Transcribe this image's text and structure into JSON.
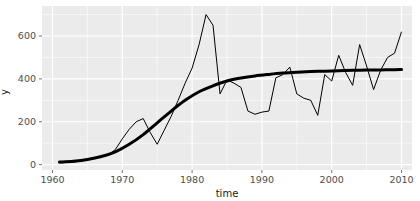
{
  "toolbar": {
    "visible": true,
    "note": "partially cropped toolbar strip"
  },
  "plot": {
    "panel_bg": "#ebebeb",
    "grid_color": "#ffffff",
    "page_bg": "#ffffff",
    "axis_text_color": "#4d4d4d",
    "axis_title_color": "#1a1a1a",
    "data_line_color": "#000000",
    "fit_line_color": "#000000",
    "x_title": "time",
    "y_title": "y",
    "x_ticks": [
      "1960",
      "1970",
      "1980",
      "1990",
      "2000",
      "2010"
    ],
    "y_ticks": [
      "0",
      "200",
      "400",
      "600"
    ]
  },
  "chart_data": {
    "type": "line",
    "title": "",
    "subtitle": "",
    "xlabel": "time",
    "ylabel": "y",
    "xlim": [
      1958.5,
      2011.5
    ],
    "ylim": [
      -25,
      740
    ],
    "grid": true,
    "legend": "none",
    "x_ticks": [
      1960,
      1970,
      1980,
      1990,
      2000,
      2010
    ],
    "y_ticks": [
      0,
      200,
      400,
      600
    ],
    "series": [
      {
        "name": "observed",
        "style": "thin-line",
        "linewidth": 1,
        "color": "#000000",
        "x": [
          1961,
          1962,
          1963,
          1964,
          1965,
          1966,
          1967,
          1968,
          1969,
          1970,
          1971,
          1972,
          1973,
          1974,
          1975,
          1976,
          1977,
          1978,
          1979,
          1980,
          1981,
          1982,
          1983,
          1984,
          1985,
          1986,
          1987,
          1988,
          1989,
          1990,
          1991,
          1992,
          1993,
          1994,
          1995,
          1996,
          1997,
          1998,
          1999,
          2000,
          2001,
          2002,
          2003,
          2004,
          2005,
          2006,
          2007,
          2008,
          2009,
          2010
        ],
        "y": [
          8,
          10,
          12,
          16,
          22,
          30,
          38,
          45,
          70,
          120,
          165,
          200,
          215,
          150,
          95,
          160,
          225,
          300,
          380,
          450,
          560,
          700,
          650,
          330,
          395,
          380,
          360,
          250,
          235,
          245,
          250,
          405,
          420,
          455,
          330,
          310,
          300,
          230,
          420,
          390,
          510,
          430,
          370,
          560,
          460,
          350,
          440,
          500,
          520,
          620
        ]
      },
      {
        "name": "fitted (logistic smooth)",
        "style": "thick-line",
        "linewidth": 3,
        "color": "#000000",
        "x": [
          1961,
          1963,
          1965,
          1967,
          1969,
          1971,
          1973,
          1975,
          1977,
          1979,
          1981,
          1983,
          1985,
          1987,
          1989,
          1991,
          1993,
          1995,
          1997,
          1999,
          2001,
          2003,
          2005,
          2007,
          2009,
          2010
        ],
        "y": [
          12,
          16,
          24,
          38,
          60,
          95,
          140,
          195,
          250,
          300,
          340,
          368,
          390,
          404,
          414,
          421,
          427,
          431,
          434,
          436,
          438,
          440,
          441,
          442,
          443,
          444
        ]
      }
    ],
    "annotations": [
      {
        "text": "peak",
        "x": 1982,
        "y": 700
      },
      {
        "text": "trough",
        "x": 1974,
        "y": 150
      },
      {
        "text": "trough",
        "x": 1998,
        "y": 230
      }
    ]
  }
}
